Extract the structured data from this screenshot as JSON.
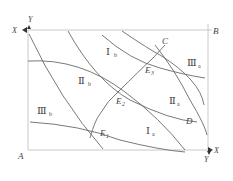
{
  "diagram": {
    "corners": {
      "A": "A",
      "B": "B",
      "C": "C",
      "D": "D"
    },
    "axes": {
      "top_left": {
        "x_label": "X",
        "y_label": "Y"
      },
      "bottom_right": {
        "x_label": "X",
        "y_label": "Y"
      }
    },
    "regions": [
      {
        "id": "Ib",
        "numeral": "Ⅰ",
        "sub": "b"
      },
      {
        "id": "IIb",
        "numeral": "Ⅱ",
        "sub": "b"
      },
      {
        "id": "IIIb",
        "numeral": "Ⅲ",
        "sub": "b"
      },
      {
        "id": "Ia",
        "numeral": "Ⅰ",
        "sub": "a"
      },
      {
        "id": "IIa",
        "numeral": "Ⅱ",
        "sub": "a"
      },
      {
        "id": "IIIa",
        "numeral": "Ⅲ",
        "sub": "a"
      }
    ],
    "points": [
      {
        "id": "E1",
        "main": "E",
        "sub": "1"
      },
      {
        "id": "E2",
        "main": "E",
        "sub": "2"
      },
      {
        "id": "E3",
        "main": "E",
        "sub": "3"
      }
    ],
    "colors": {
      "frame": "#c8c8c8",
      "curve": "#6a6a6a",
      "text": "#444444"
    }
  }
}
